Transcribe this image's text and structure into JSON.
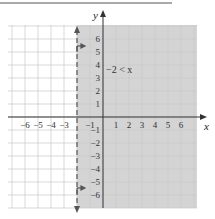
{
  "chart_data": {
    "type": "inequality-graph",
    "title": "",
    "inequality": "-2 < x",
    "boundary": {
      "x": -2,
      "style": "dashed",
      "included": false
    },
    "shaded_region": "x > -2",
    "xlabel": "x",
    "ylabel": "y",
    "xlim": [
      -6.5,
      6.5
    ],
    "ylim": [
      -6.5,
      6.5
    ],
    "x_ticks": [
      -6,
      -5,
      -4,
      -3,
      -1,
      1,
      2,
      3,
      4,
      5,
      6
    ],
    "y_ticks": [
      6,
      5,
      4,
      3,
      2,
      1,
      -1,
      -2,
      -3,
      -4,
      -5,
      -6
    ],
    "grid": true,
    "colors": {
      "shade": "#d4d4d4",
      "grid": "#c8c8c8",
      "axis": "#333333"
    }
  },
  "labels": {
    "x_axis": "x",
    "y_axis": "y",
    "annotation": "−2 < x",
    "x_ticks": [
      "−6",
      "−5",
      "−4",
      "−3",
      "−1",
      "1",
      "2",
      "3",
      "4",
      "5",
      "6"
    ],
    "y_ticks": [
      "6",
      "5",
      "4",
      "3",
      "2",
      "1",
      "−1",
      "−2",
      "−3",
      "−4",
      "−5",
      "−6"
    ]
  }
}
